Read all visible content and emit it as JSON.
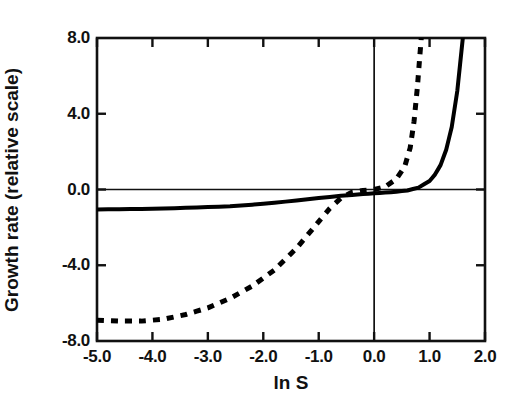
{
  "chart_data": {
    "type": "line",
    "title": "",
    "xlabel": "ln S",
    "ylabel": "Growth rate (relative scale)",
    "xlim": [
      -5.0,
      2.0
    ],
    "ylim": [
      -8.0,
      8.0
    ],
    "xticks": [
      "-5.0",
      "-4.0",
      "-3.0",
      "-2.0",
      "-1.0",
      "0.0",
      "1.0",
      "2.0"
    ],
    "xtick_values": [
      -5.0,
      -4.0,
      -3.0,
      -2.0,
      -1.0,
      0.0,
      1.0,
      2.0
    ],
    "yticks": [
      "8.0",
      "4.0",
      "0.0",
      "-4.0",
      "-8.0"
    ],
    "ytick_values": [
      8.0,
      4.0,
      0.0,
      -4.0,
      -8.0
    ],
    "grid": false,
    "legend": null,
    "annotations": [
      {
        "name": "zero-horizontal-line",
        "value": 0.0,
        "orientation": "horizontal"
      },
      {
        "name": "zero-vertical-line",
        "value": 0.0,
        "orientation": "vertical"
      }
    ],
    "series": [
      {
        "name": "solid-curve",
        "style": "solid",
        "color": "#000000",
        "linewidth": 4,
        "x": [
          -5.0,
          -4.6,
          -4.2,
          -3.8,
          -3.4,
          -3.0,
          -2.6,
          -2.2,
          -1.8,
          -1.4,
          -1.0,
          -0.6,
          -0.2,
          0.0,
          0.2,
          0.4,
          0.6,
          0.8,
          1.0,
          1.1,
          1.2,
          1.3,
          1.4,
          1.5,
          1.55,
          1.6
        ],
        "y": [
          -1.05,
          -1.04,
          -1.03,
          -1.0,
          -0.97,
          -0.93,
          -0.88,
          -0.8,
          -0.7,
          -0.58,
          -0.45,
          -0.33,
          -0.24,
          -0.2,
          -0.16,
          -0.12,
          -0.05,
          0.1,
          0.45,
          0.8,
          1.3,
          2.1,
          3.3,
          5.2,
          6.6,
          8.0
        ]
      },
      {
        "name": "dashed-curve",
        "style": "dashed",
        "color": "#000000",
        "linewidth": 5,
        "x": [
          -5.0,
          -4.6,
          -4.2,
          -3.8,
          -3.4,
          -3.0,
          -2.6,
          -2.2,
          -1.8,
          -1.4,
          -1.0,
          -0.8,
          -0.6,
          -0.4,
          -0.2,
          0.0,
          0.2,
          0.4,
          0.55,
          0.65,
          0.72,
          0.78,
          0.82,
          0.85
        ],
        "y": [
          -6.9,
          -6.95,
          -6.95,
          -6.85,
          -6.6,
          -6.25,
          -5.75,
          -5.1,
          -4.25,
          -3.1,
          -1.7,
          -1.0,
          -0.45,
          -0.15,
          -0.05,
          0.0,
          0.15,
          0.55,
          1.2,
          2.2,
          3.6,
          5.4,
          6.9,
          8.0
        ]
      }
    ]
  },
  "axes_geometry": {
    "left_px": 97,
    "right_px": 485,
    "top_px": 38,
    "bottom_px": 341
  }
}
